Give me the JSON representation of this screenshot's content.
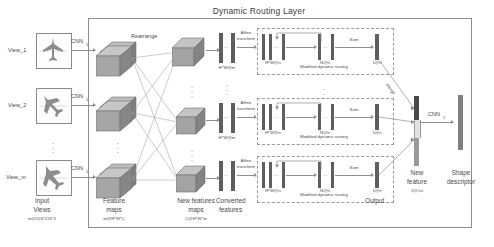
{
  "figure": {
    "title": "Dynamic Routing Layer",
    "type": "neural-network-architecture-diagram"
  },
  "inputs": {
    "caption_line1": "Input",
    "caption_line2": "Views",
    "caption_dims": "m@224*224*3",
    "views": [
      {
        "label": "View_1",
        "icon": "airplane-front-thumbnail"
      },
      {
        "label": "View_2",
        "icon": "airplane-angled-thumbnail"
      },
      {
        "label": "View_m",
        "icon": "airplane-side-thumbnail"
      }
    ],
    "vertical_ellipsis": "⋮"
  },
  "encoder": {
    "cnn_label": "CNN",
    "cnn_sub": "1"
  },
  "feature_maps": {
    "caption_line1": "Feature",
    "caption_line2": "maps",
    "caption_dims": "m@H*W*C"
  },
  "rearrange": {
    "label": "Rearrange"
  },
  "new_feature_maps": {
    "caption_line1": "New features",
    "caption_line2": "maps",
    "caption_dims": "C@H*W*m"
  },
  "converted": {
    "caption_line1": "Converted",
    "caption_line2": "features",
    "dims": "H*W@m",
    "affine_line1": "Affine",
    "affine_line2": "transform"
  },
  "routing": {
    "box_label": "Modified dynamic routing",
    "input_dims": "H*W@n",
    "mid_dims": "N@n",
    "out_dims": "1@n",
    "sum_label": "Sum",
    "output_caption": "Output",
    "rows": 3
  },
  "merge": {
    "label": "Merge"
  },
  "new_feature": {
    "caption_line1": "New",
    "caption_line2": "feature",
    "caption_dims": "1@Cn"
  },
  "classifier": {
    "cnn_label": "CNN",
    "cnn_sub": "2"
  },
  "shape_descriptor": {
    "caption_line1": "Shape",
    "caption_line2": "descriptor"
  },
  "colors": {
    "stroke": "#8e8e8e",
    "dash": "#9a9a9a",
    "cube_top": "#b9b9b9",
    "cube_front": "#9a9a9a",
    "cube_side": "#7e7e7e",
    "bar_dark": "#5e5e5e",
    "bar_mid": "#8a8a8a",
    "bar_light": "#c6c6c6",
    "text": "#4a4a4a"
  }
}
